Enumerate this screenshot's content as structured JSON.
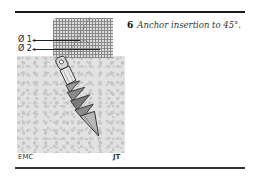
{
  "figure": {
    "labels": {
      "diameter_1": "Ø 1",
      "diameter_2": "Ø 2"
    },
    "credits": {
      "left": "EMC",
      "right": "JT"
    },
    "colors": {
      "rule": "#1a1a1a",
      "grid_bg": "#dcdcdc",
      "bone_bg": "#e2e2e2"
    }
  },
  "caption": {
    "number": "6",
    "text": "Anchor insertion to 45°."
  }
}
